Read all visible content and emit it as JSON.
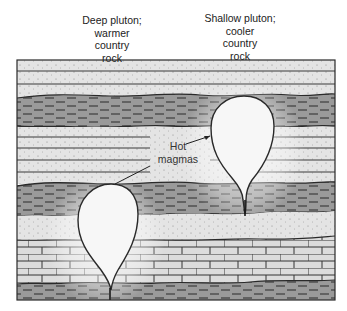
{
  "labels": {
    "deep_pluton": {
      "lines": [
        "Deep pluton;",
        "warmer",
        "country",
        "rock"
      ]
    },
    "shallow_pluton": {
      "lines": [
        "Shallow pluton;",
        "cooler",
        "country",
        "rock"
      ]
    },
    "hot_magmas": {
      "lines": [
        "Hot",
        "magmas"
      ]
    }
  },
  "diagram": {
    "type": "geologic cross-section",
    "layers_top_to_bottom": [
      {
        "rock": "sandstone",
        "top": 60,
        "bottom": 71
      },
      {
        "rock": "sandstone",
        "top": 71,
        "bottom": 84
      },
      {
        "rock": "sandstone",
        "top": 84,
        "bottom": 96
      },
      {
        "rock": "shale",
        "top": 96,
        "bottom": 126
      },
      {
        "rock": "sandstone",
        "top": 126,
        "bottom": 137
      },
      {
        "rock": "sandstone",
        "top": 137,
        "bottom": 148
      },
      {
        "rock": "sandstone",
        "top": 148,
        "bottom": 160
      },
      {
        "rock": "sandstone",
        "top": 160,
        "bottom": 172
      },
      {
        "rock": "sandstone",
        "top": 172,
        "bottom": 184
      },
      {
        "rock": "shale",
        "top": 184,
        "bottom": 216
      },
      {
        "rock": "sandstone",
        "top": 216,
        "bottom": 240
      },
      {
        "rock": "limestone",
        "top": 240,
        "bottom": 283
      },
      {
        "rock": "shale",
        "top": 283,
        "bottom": 300
      }
    ],
    "plutons": [
      {
        "name": "shallow-pluton",
        "depth": "shallow"
      },
      {
        "name": "deep-pluton",
        "depth": "deep"
      }
    ],
    "colors": {
      "sandstone": "#e4e4e4",
      "shale": "#9a9a9a",
      "limestone": "#d6d6d6",
      "magma": "#f7f7f7",
      "outline": "#2a2a2a",
      "halo": "#cfcfcf"
    }
  }
}
